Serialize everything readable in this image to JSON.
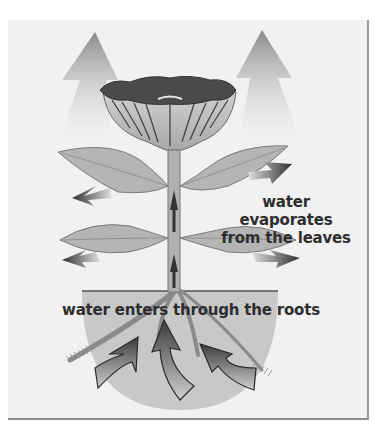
{
  "diagram": {
    "labels": {
      "evaporation": [
        "water evaporates",
        "from the leaves"
      ],
      "roots": "water enters through the roots"
    },
    "elements": [
      "flower",
      "stem",
      "upper-leaves",
      "lower-leaves",
      "soil",
      "roots",
      "upward-vapor-arrows",
      "leaf-evaporation-arrows",
      "stem-flow-arrows",
      "root-intake-arrows"
    ],
    "colors": {
      "panel_bg": "#f1f1f1",
      "leaf": "#b5b5b5",
      "leaf_edge": "#7a7a7a",
      "flower_dark": "#4a4a4a",
      "soil": "#c8c8c8",
      "arrow_dark": "#3a3a3a",
      "text": "#2e2e2e"
    }
  }
}
